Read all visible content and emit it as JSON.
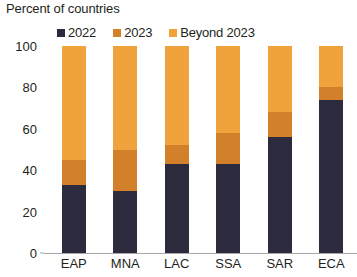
{
  "chart_data": {
    "type": "bar",
    "title": "Percent of countries",
    "subtitle": "",
    "xlabel": "",
    "ylabel": "",
    "stacked": true,
    "grid": false,
    "legend_position": "top",
    "ylim": [
      0,
      100
    ],
    "yticks": [
      0,
      20,
      40,
      60,
      80,
      100
    ],
    "ytick_labels": [
      "0",
      "20",
      "40",
      "60",
      "80",
      "100"
    ],
    "categories": [
      "EAP",
      "MNA",
      "LAC",
      "SSA",
      "SAR",
      "ECA"
    ],
    "series": [
      {
        "name": "2022",
        "color": "#2b2b3d",
        "values": [
          33,
          30,
          43,
          43,
          56,
          74
        ]
      },
      {
        "name": "2023",
        "color": "#d2802a",
        "values": [
          12,
          20,
          9,
          15,
          12,
          6
        ]
      },
      {
        "name": "Beyond 2023",
        "color": "#f0a33c",
        "values": [
          55,
          50,
          48,
          42,
          32,
          20
        ]
      }
    ]
  },
  "axis": {
    "baseline_color": "#a7a7a7"
  }
}
